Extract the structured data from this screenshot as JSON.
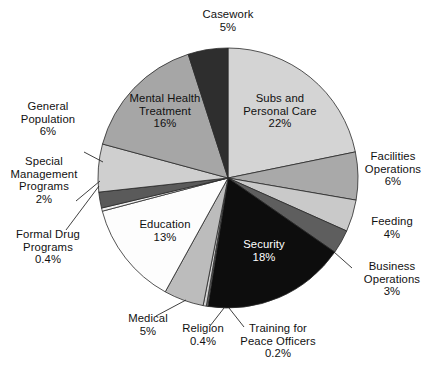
{
  "chart_data": {
    "type": "pie",
    "title": "",
    "subtitle": "",
    "xlabel": "",
    "ylabel": "",
    "legend_position": "none",
    "grid": false,
    "units": "percent",
    "start_angle_deg": 0,
    "direction": "clockwise",
    "labels": [
      "Subs and Personal Care",
      "Facilities Operations",
      "Feeding",
      "Business Operations",
      "Security",
      "Training for Peace Officers",
      "Religion",
      "Medical",
      "Education",
      "Formal Drug Programs",
      "Special Management Programs",
      "General Population",
      "Mental Health Treatment",
      "Casework"
    ],
    "values": [
      22,
      6,
      4,
      3,
      18,
      0.2,
      0.4,
      5,
      13,
      0.4,
      2,
      6,
      16,
      5
    ],
    "value_labels": [
      "22%",
      "6%",
      "4%",
      "3%",
      "18%",
      "0.2%",
      "0.4%",
      "5%",
      "13%",
      "0.4%",
      "2%",
      "6%",
      "16%",
      "5%"
    ],
    "colors": [
      "#d4d4d4",
      "#a9a9a9",
      "#c9c9c9",
      "#5e5e5e",
      "#0d0d0d",
      "#7a7a7a",
      "#d0d0d0",
      "#bcbcbc",
      "#fdfdfd",
      "#f0f0f0",
      "#5a5a5a",
      "#cfcfcf",
      "#a6a6a6",
      "#2e2e2e"
    ],
    "slices": [
      {
        "name": "Subs and Personal Care",
        "value": 22,
        "value_label": "22%",
        "color": "#d4d4d4",
        "label_placement": "inside",
        "label_color": "dark"
      },
      {
        "name": "Facilities Operations",
        "value": 6,
        "value_label": "6%",
        "color": "#a9a9a9",
        "label_placement": "outside"
      },
      {
        "name": "Feeding",
        "value": 4,
        "value_label": "4%",
        "color": "#c9c9c9",
        "label_placement": "outside"
      },
      {
        "name": "Business Operations",
        "value": 3,
        "value_label": "3%",
        "color": "#5e5e5e",
        "label_placement": "outside-leader"
      },
      {
        "name": "Security",
        "value": 18,
        "value_label": "18%",
        "color": "#0d0d0d",
        "label_placement": "inside",
        "label_color": "light"
      },
      {
        "name": "Training for Peace Officers",
        "value": 0.2,
        "value_label": "0.2%",
        "color": "#7a7a7a",
        "label_placement": "outside-leader"
      },
      {
        "name": "Religion",
        "value": 0.4,
        "value_label": "0.4%",
        "color": "#d0d0d0",
        "label_placement": "outside-leader"
      },
      {
        "name": "Medical",
        "value": 5,
        "value_label": "5%",
        "color": "#bcbcbc",
        "label_placement": "outside-leader"
      },
      {
        "name": "Education",
        "value": 13,
        "value_label": "13%",
        "color": "#fdfdfd",
        "label_placement": "inside",
        "label_color": "dark"
      },
      {
        "name": "Formal Drug Programs",
        "value": 0.4,
        "value_label": "0.4%",
        "color": "#f0f0f0",
        "label_placement": "outside-leader"
      },
      {
        "name": "Special Management Programs",
        "value": 2,
        "value_label": "2%",
        "color": "#5a5a5a",
        "label_placement": "outside-leader"
      },
      {
        "name": "General Population",
        "value": 6,
        "value_label": "6%",
        "color": "#cfcfcf",
        "label_placement": "outside-leader"
      },
      {
        "name": "Mental Health Treatment",
        "value": 16,
        "value_label": "16%",
        "color": "#a6a6a6",
        "label_placement": "inside",
        "label_color": "dark"
      },
      {
        "name": "Casework",
        "value": 5,
        "value_label": "5%",
        "color": "#2e2e2e",
        "label_placement": "outside"
      }
    ]
  },
  "labels": {
    "casework": {
      "line1": "Casework",
      "line2": "5%"
    },
    "subs_personal_care": {
      "line1": "Subs and",
      "line2": "Personal Care",
      "line3": "22%"
    },
    "facilities_operations": {
      "line1": "Facilities",
      "line2": "Operations",
      "line3": "6%"
    },
    "feeding": {
      "line1": "Feeding",
      "line2": "4%"
    },
    "business_operations": {
      "line1": "Business",
      "line2": "Operations",
      "line3": "3%"
    },
    "security": {
      "line1": "Security",
      "line2": "18%"
    },
    "training_peace_officers": {
      "line1": "Training for",
      "line2": "Peace Officers",
      "line3": "0.2%"
    },
    "religion": {
      "line1": "Religion",
      "line2": "0.4%"
    },
    "medical": {
      "line1": "Medical",
      "line2": "5%"
    },
    "education": {
      "line1": "Education",
      "line2": "13%"
    },
    "formal_drug_programs": {
      "line1": "Formal Drug",
      "line2": "Programs",
      "line3": "0.4%"
    },
    "special_management_programs": {
      "line1": "Special",
      "line2": "Management",
      "line3": "Programs",
      "line4": "2%"
    },
    "general_population": {
      "line1": "General",
      "line2": "Population",
      "line3": "6%"
    },
    "mental_health_treatment": {
      "line1": "Mental Health",
      "line2": "Treatment",
      "line3": "16%"
    }
  }
}
